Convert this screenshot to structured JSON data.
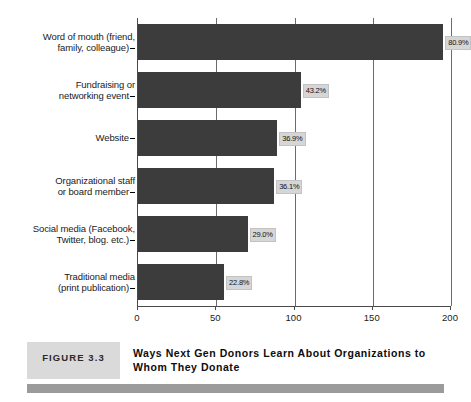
{
  "figure": {
    "tag": "FIGURE 3.3",
    "title_line1": "Ways Next Gen Donors Learn About Organizations",
    "title_line2": "to Whom They Donate"
  },
  "colors": {
    "bar": "#3c3c3c",
    "value_box": "#d6d6d6",
    "grid": "#6b6b6b",
    "axis": "#4a4a4a",
    "tag_box": "#dadada",
    "band": "#9b9b9b"
  },
  "chart_data": {
    "type": "bar",
    "orientation": "horizontal",
    "title": "Ways Next Gen Donors Learn About Organizations to Whom They Donate",
    "xlabel": "",
    "ylabel": "",
    "xlim": [
      0,
      200
    ],
    "xticks": [
      0,
      50,
      100,
      150,
      200
    ],
    "grid": true,
    "grid_axis": "x",
    "legend": false,
    "categories": [
      "Word of mouth (friend, family, colleague)",
      "Fundraising or networking event",
      "Website",
      "Organizational staff or board member",
      "Social media (Facebook, Twitter, blog. etc.)",
      "Traditional media (print publication)"
    ],
    "category_lines": [
      [
        "Word of mouth (friend,",
        "family, colleague)"
      ],
      [
        "Fundraising or",
        "networking event"
      ],
      [
        "Website"
      ],
      [
        "Organizational staff",
        "or board member"
      ],
      [
        "Social media (Facebook,",
        "Twitter, blog. etc.)"
      ],
      [
        "Traditional media",
        "(print publication)"
      ]
    ],
    "values": [
      195,
      104,
      89,
      87,
      70,
      55
    ],
    "data_labels": [
      "80.9%",
      "43.2%",
      "36.9%",
      "36.1%",
      "29.0%",
      "22.8%"
    ]
  }
}
